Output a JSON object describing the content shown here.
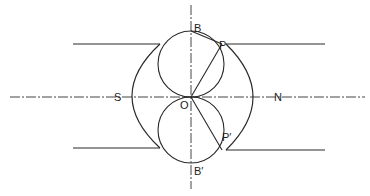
{
  "diagram": {
    "type": "magnetic field / pole pieces geometric construction",
    "colors": {
      "ink": "#2a2a2a",
      "background": "#ffffff"
    },
    "labels": {
      "south": "S",
      "north": "N",
      "origin": "O",
      "top": "B",
      "bottom": "B′",
      "point_upper": "P",
      "point_lower": "P′"
    },
    "elements": {
      "horizontal_axis": "dash-dot line S–N through O",
      "vertical_axis": "dash-dot line through B, O, B′",
      "upper_circle": "circle with diameter OB",
      "lower_circle": "circle with diameter OB′",
      "chord_OP": "line from O to P",
      "chord_BP": "line from B to P",
      "chord_OP_prime": "line from O to P′",
      "left_pole_piece": "concave pole face S with parallel edges",
      "right_pole_piece": "concave pole face N with parallel edges"
    }
  }
}
